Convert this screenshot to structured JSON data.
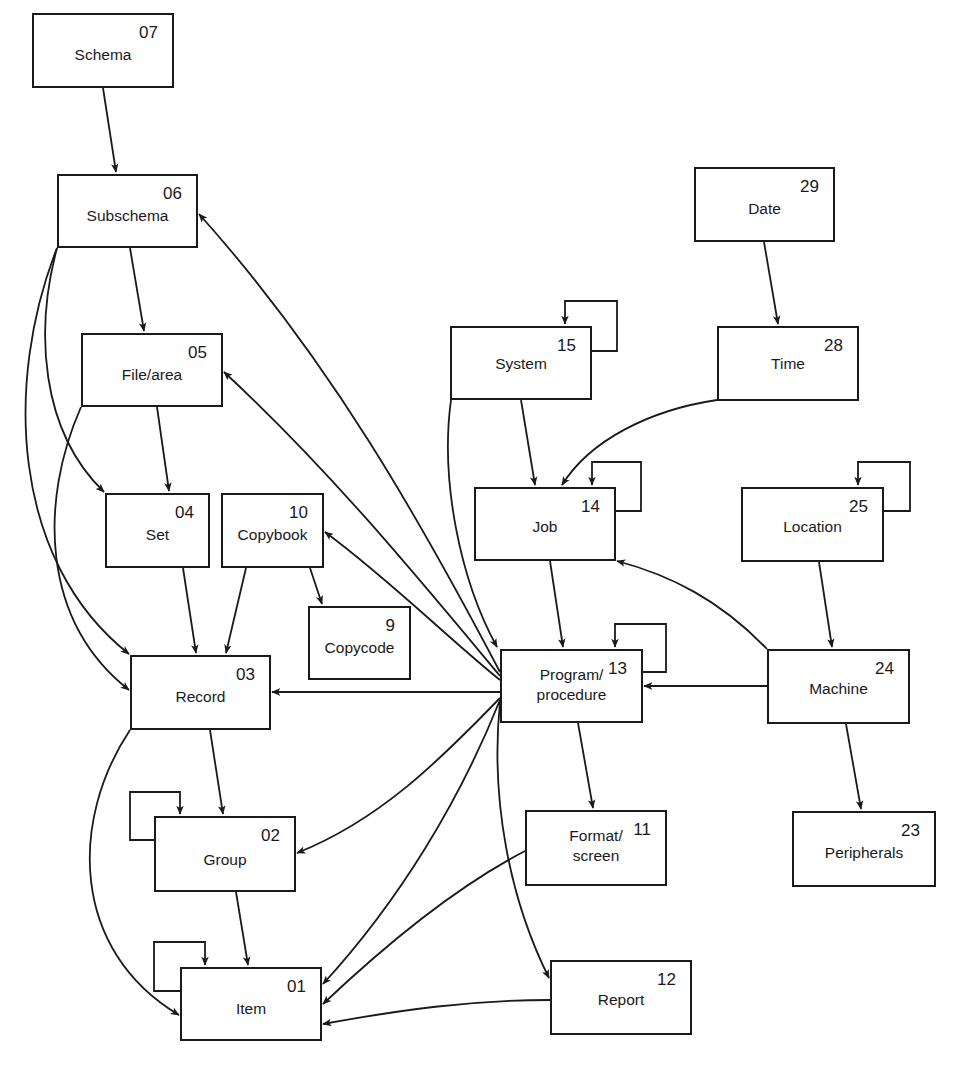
{
  "diagram": {
    "type": "data-dictionary entity relationship diagram",
    "colors": {
      "stroke": "#1a1a1a",
      "background": "#ffffff"
    },
    "nodes": [
      {
        "id": "07",
        "name": "Schema",
        "x": 32,
        "y": 13,
        "w": 142,
        "h": 75,
        "label_y": 30
      },
      {
        "id": "06",
        "name": "Subschema",
        "x": 57,
        "y": 174,
        "w": 141,
        "h": 74,
        "label_y": 30
      },
      {
        "id": "05",
        "name": "File/area",
        "x": 81,
        "y": 333,
        "w": 142,
        "h": 74,
        "label_y": 30
      },
      {
        "id": "04",
        "name": "Set",
        "x": 105,
        "y": 493,
        "w": 105,
        "h": 75,
        "label_y": 30
      },
      {
        "id": "10",
        "name": "Copybook",
        "x": 221,
        "y": 493,
        "w": 103,
        "h": 75,
        "label_y": 30
      },
      {
        "id": "9",
        "name": "Copycode",
        "x": 308,
        "y": 606,
        "w": 103,
        "h": 74,
        "label_y": 30
      },
      {
        "id": "03",
        "name": "Record",
        "x": 130,
        "y": 655,
        "w": 141,
        "h": 75,
        "label_y": 30
      },
      {
        "id": "02",
        "name": "Group",
        "x": 154,
        "y": 816,
        "w": 142,
        "h": 76,
        "label_y": 32
      },
      {
        "id": "01",
        "name": "Item",
        "x": 180,
        "y": 967,
        "w": 142,
        "h": 74,
        "label_y": 30
      },
      {
        "id": "15",
        "name": "System",
        "x": 450,
        "y": 326,
        "w": 142,
        "h": 74,
        "label_y": 26
      },
      {
        "id": "14",
        "name": "Job",
        "x": 474,
        "y": 487,
        "w": 142,
        "h": 74,
        "label_y": 28
      },
      {
        "id": "13",
        "name": "Program/\nprocedure",
        "x": 500,
        "y": 649,
        "w": 143,
        "h": 74,
        "label_y": 14
      },
      {
        "id": "11",
        "name": "Format/\nscreen",
        "x": 525,
        "y": 810,
        "w": 142,
        "h": 76,
        "label_y": 14
      },
      {
        "id": "12",
        "name": "Report",
        "x": 550,
        "y": 960,
        "w": 142,
        "h": 75,
        "label_y": 28
      },
      {
        "id": "29",
        "name": "Date",
        "x": 694,
        "y": 167,
        "w": 141,
        "h": 75,
        "label_y": 30
      },
      {
        "id": "28",
        "name": "Time",
        "x": 717,
        "y": 326,
        "w": 142,
        "h": 75,
        "label_y": 26
      },
      {
        "id": "25",
        "name": "Location",
        "x": 741,
        "y": 487,
        "w": 143,
        "h": 75,
        "label_y": 28
      },
      {
        "id": "24",
        "name": "Machine",
        "x": 767,
        "y": 649,
        "w": 143,
        "h": 75,
        "label_y": 28
      },
      {
        "id": "23",
        "name": "Peripherals",
        "x": 792,
        "y": 811,
        "w": 144,
        "h": 76,
        "label_y": 30
      }
    ],
    "edges": [
      {
        "from": "Schema",
        "to": "Subschema",
        "d": "M103,88 L116,172"
      },
      {
        "from": "Subschema",
        "to": "File/area",
        "d": "M130,248 L144,331"
      },
      {
        "from": "Subschema",
        "to": "Set",
        "d": "M57,248 C35,330 40,430 104,492"
      },
      {
        "from": "Subschema",
        "to": "Record",
        "d": "M57,248 C5,380 10,560 129,654"
      },
      {
        "from": "File/area",
        "to": "Set",
        "d": "M157,407 L169,491"
      },
      {
        "from": "File/area",
        "to": "Record",
        "d": "M81,407 C40,500 40,620 129,690"
      },
      {
        "from": "Set",
        "to": "Record",
        "d": "M183,568 L196,653"
      },
      {
        "from": "Copybook",
        "to": "Record",
        "d": "M246,568 L226,653"
      },
      {
        "from": "Copybook",
        "to": "Copycode",
        "d": "M310,568 L322,604"
      },
      {
        "from": "Record",
        "to": "Group",
        "d": "M210,730 L223,814"
      },
      {
        "from": "Record",
        "to": "Item",
        "d": "M130,730 C70,820 70,950 179,1015"
      },
      {
        "from": "Group",
        "to": "Group",
        "d": "M154,840 L130,840 L130,792 L180,792 L180,814"
      },
      {
        "from": "Group",
        "to": "Item",
        "d": "M236,892 L248,965"
      },
      {
        "from": "Item",
        "to": "Item",
        "d": "M180,991 L154,991 L154,942 L205,942 L205,965"
      },
      {
        "from": "System",
        "to": "System",
        "d": "M592,351 L617,351 L617,301 L565,301 L565,324"
      },
      {
        "from": "System",
        "to": "Job",
        "d": "M521,400 L535,485"
      },
      {
        "from": "System",
        "to": "Program",
        "d": "M451,400 C440,480 460,580 497,647"
      },
      {
        "from": "Date",
        "to": "Time",
        "d": "M764,242 L778,324"
      },
      {
        "from": "Time",
        "to": "Job",
        "d": "M717,400 C650,410 590,440 562,485"
      },
      {
        "from": "Job",
        "to": "Job",
        "d": "M616,511 L641,511 L641,462 L592,462 L592,485"
      },
      {
        "from": "Job",
        "to": "Program",
        "d": "M550,561 L563,647"
      },
      {
        "from": "Program",
        "to": "Program",
        "d": "M643,672 L666,672 L666,624 L615,624 L615,647"
      },
      {
        "from": "Program",
        "to": "Subschema",
        "d": "M500,672 C420,520 330,360 199,214"
      },
      {
        "from": "Program",
        "to": "File/area",
        "d": "M500,676 C420,580 330,470 224,372"
      },
      {
        "from": "Program",
        "to": "Copybook",
        "d": "M500,680 C450,640 390,580 325,532"
      },
      {
        "from": "Program",
        "to": "Record",
        "d": "M500,692 L272,692"
      },
      {
        "from": "Program",
        "to": "Group",
        "d": "M500,698 C440,760 380,820 297,853"
      },
      {
        "from": "Program",
        "to": "Item",
        "d": "M500,700 C460,800 400,900 323,984"
      },
      {
        "from": "Program",
        "to": "Report",
        "d": "M500,702 C490,800 510,900 549,978"
      },
      {
        "from": "Program",
        "to": "Format",
        "d": "M578,723 L593,808"
      },
      {
        "from": "Format",
        "to": "Item",
        "d": "M525,851 C450,890 380,950 323,1004"
      },
      {
        "from": "Report",
        "to": "Item",
        "d": "M550,1000 C470,1000 400,1010 323,1024"
      },
      {
        "from": "Location",
        "to": "Location",
        "d": "M884,511 L910,511 L910,462 L858,462 L858,485"
      },
      {
        "from": "Location",
        "to": "Machine",
        "d": "M819,562 L832,647"
      },
      {
        "from": "Machine",
        "to": "Job",
        "d": "M767,649 C720,600 670,575 617,561"
      },
      {
        "from": "Machine",
        "to": "Program",
        "d": "M767,686 L644,686"
      },
      {
        "from": "Machine",
        "to": "Peripherals",
        "d": "M846,724 L861,809"
      }
    ]
  }
}
